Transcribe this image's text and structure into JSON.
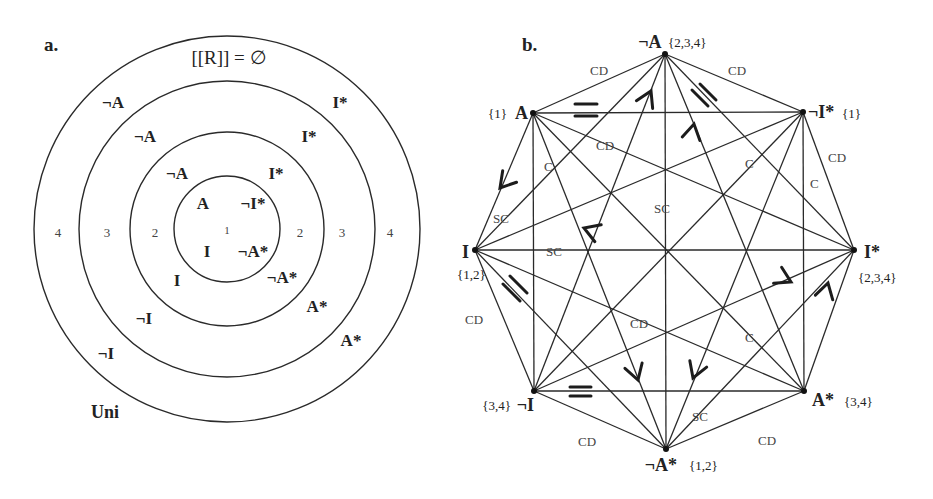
{
  "panel_a": {
    "letter": "a.",
    "empty_label": "[[R]] = ∅",
    "universe_label": "Uni",
    "ring_numbers": {
      "left": [
        "4",
        "3",
        "2"
      ],
      "center": "1",
      "right": [
        "2",
        "3",
        "4"
      ]
    },
    "inner_labels": [
      "A",
      "¬I*",
      "I",
      "¬A*"
    ],
    "ring2_labels": [
      "¬A",
      "I*",
      "I",
      "¬A*"
    ],
    "ring3_labels": [
      "¬A",
      "I*",
      "¬I",
      "A*"
    ],
    "ring4_labels": [
      "¬A",
      "I*",
      "¬I",
      "A*"
    ]
  },
  "panel_b": {
    "letter": "b.",
    "vertices": [
      {
        "id": "negA",
        "label": "¬A",
        "set": "{2,3,4}"
      },
      {
        "id": "negIstar",
        "label": "¬I*",
        "set": "{1}"
      },
      {
        "id": "Istar",
        "label": "I*",
        "set": "{2,3,4}"
      },
      {
        "id": "Astar",
        "label": "A*",
        "set": "{3,4}"
      },
      {
        "id": "negAstar",
        "label": "¬A*",
        "set": "{1,2}"
      },
      {
        "id": "negI",
        "label": "¬I",
        "set": "{3,4}"
      },
      {
        "id": "I",
        "label": "I",
        "set": "{1,2}"
      },
      {
        "id": "A",
        "label": "A",
        "set": "{1}"
      }
    ],
    "relation_labels": {
      "cd": "CD",
      "c": "C",
      "sc": "SC"
    },
    "edge_labels": [
      {
        "text": "CD"
      },
      {
        "text": "CD"
      },
      {
        "text": "CD"
      },
      {
        "text": "CD"
      },
      {
        "text": "CD"
      },
      {
        "text": "CD"
      },
      {
        "text": "CD"
      },
      {
        "text": "CD"
      },
      {
        "text": "C"
      },
      {
        "text": "C"
      },
      {
        "text": "C"
      },
      {
        "text": "C"
      },
      {
        "text": "SC"
      },
      {
        "text": "SC"
      },
      {
        "text": "SC"
      },
      {
        "text": "SC"
      },
      {
        "text": "SC"
      }
    ],
    "mark_types": {
      "equivalence": "double-bar",
      "subaltern": "arrowhead"
    }
  }
}
